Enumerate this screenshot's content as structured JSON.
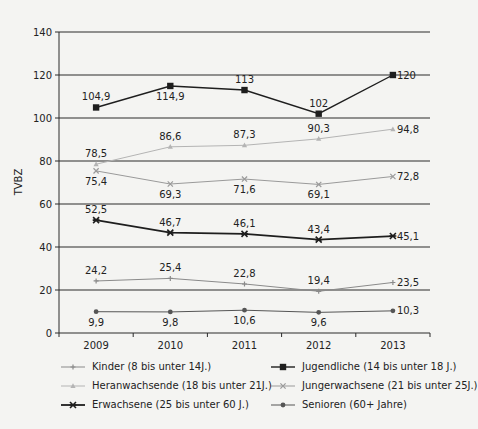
{
  "chart_data": {
    "type": "line",
    "title": "",
    "xlabel": "",
    "ylabel": "TVBZ",
    "ylim": [
      0,
      140
    ],
    "yticks": [
      0,
      20,
      40,
      60,
      80,
      100,
      120,
      140
    ],
    "grid": "horizontal",
    "legend_position": "bottom",
    "categories": [
      "2009",
      "2010",
      "2011",
      "2012",
      "2013"
    ],
    "series": [
      {
        "name": "Kinder  (8 bis unter 14J.)",
        "values": [
          24.2,
          25.4,
          22.8,
          19.4,
          23.5
        ],
        "labels": [
          "24,2",
          "25,4",
          "22,8",
          "19,4",
          "23,5"
        ],
        "color": "#8a8a8a",
        "marker": "plus",
        "width": 1
      },
      {
        "name": "Jugendliche (14 bis unter 18 J.)",
        "values": [
          104.9,
          114.9,
          113,
          102,
          120
        ],
        "labels": [
          "104,9",
          "114,9",
          "113",
          "102",
          "120"
        ],
        "color": "#1e1e1e",
        "marker": "square",
        "width": 1.4
      },
      {
        "name": "Heranwachsende (18 bis unter 21J.)",
        "values": [
          78.5,
          86.6,
          87.3,
          90.3,
          94.8
        ],
        "labels": [
          "78,5",
          "86,6",
          "87,3",
          "90,3",
          "94,8"
        ],
        "color": "#b4b4b4",
        "marker": "triangle",
        "width": 1
      },
      {
        "name": "Jungerwachsene (21 bis unter 25J.)",
        "values": [
          75.4,
          69.3,
          71.6,
          69.1,
          72.8
        ],
        "labels": [
          "75,4",
          "69,3",
          "71,6",
          "69,1",
          "72,8"
        ],
        "color": "#9a9a9a",
        "marker": "x",
        "width": 1
      },
      {
        "name": "Erwachsene (25 bis unter 60 J.)",
        "values": [
          52.5,
          46.7,
          46.1,
          43.4,
          45.1
        ],
        "labels": [
          "52,5",
          "46,7",
          "46,1",
          "43,4",
          "45,1"
        ],
        "color": "#1e1e1e",
        "marker": "star",
        "width": 1.8
      },
      {
        "name": "Senioren (60+ Jahre)",
        "values": [
          9.9,
          9.8,
          10.6,
          9.6,
          10.3
        ],
        "labels": [
          "9,9",
          "9,8",
          "10,6",
          "9,6",
          "10,3"
        ],
        "color": "#555555",
        "marker": "circle",
        "width": 1
      }
    ],
    "label_positions": [
      [
        "above",
        "above",
        "above",
        "above",
        "right"
      ],
      [
        "above",
        "below",
        "above",
        "above",
        "right"
      ],
      [
        "above",
        "above",
        "above",
        "above",
        "right"
      ],
      [
        "below",
        "below",
        "below",
        "below",
        "right"
      ],
      [
        "above",
        "above",
        "above",
        "above",
        "right"
      ],
      [
        "below",
        "below",
        "below",
        "below",
        "right"
      ]
    ]
  },
  "legend": {
    "order": [
      0,
      1,
      2,
      3,
      4,
      5
    ]
  }
}
